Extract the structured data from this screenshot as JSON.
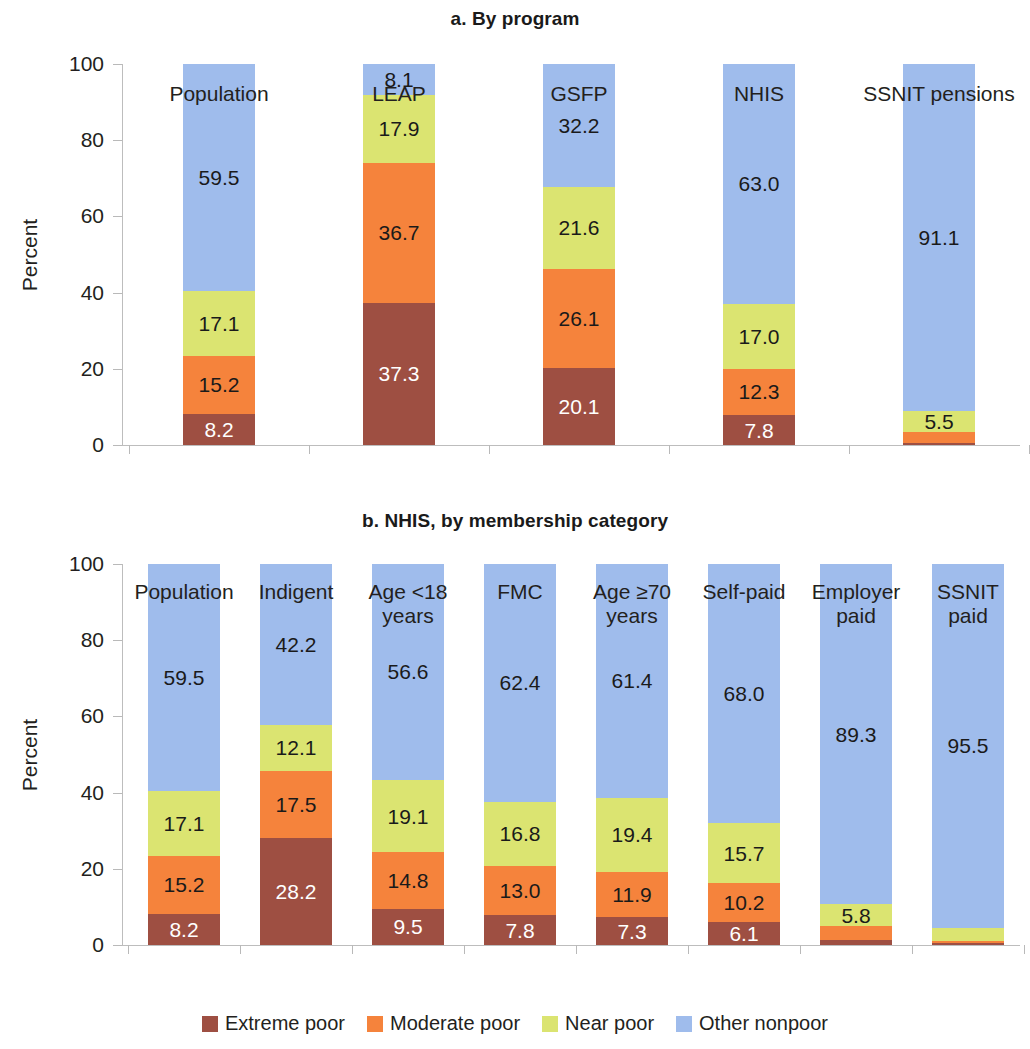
{
  "figure": {
    "legend": [
      {
        "label": "Extreme poor",
        "color": "#9e4f42"
      },
      {
        "label": "Moderate poor",
        "color": "#f5833c"
      },
      {
        "label": "Near poor",
        "color": "#dbe471"
      },
      {
        "label": "Other nonpoor",
        "color": "#9fbcec"
      }
    ]
  },
  "chart_data": [
    {
      "type": "bar",
      "stacked": true,
      "normalized": true,
      "title": "a. By program",
      "xlabel": "",
      "ylabel": "Percent",
      "ylim": [
        0,
        100
      ],
      "yticks": [
        0,
        20,
        40,
        60,
        80,
        100
      ],
      "grid": false,
      "legend_position": "bottom",
      "categories": [
        "Population",
        "LEAP",
        "GSFP",
        "NHIS",
        "SSNIT pensions"
      ],
      "series": [
        {
          "name": "Extreme poor",
          "color": "#9e4f42",
          "values": [
            8.2,
            37.3,
            20.1,
            7.8,
            0.5
          ],
          "labels": [
            "8.2",
            "37.3",
            "20.1",
            "7.8",
            ""
          ]
        },
        {
          "name": "Moderate poor",
          "color": "#f5833c",
          "values": [
            15.2,
            36.7,
            26.1,
            12.3,
            2.9
          ],
          "labels": [
            "15.2",
            "36.7",
            "26.1",
            "12.3",
            ""
          ]
        },
        {
          "name": "Near poor",
          "color": "#dbe471",
          "values": [
            17.1,
            17.9,
            21.6,
            17.0,
            5.5
          ],
          "labels": [
            "17.1",
            "17.9",
            "21.6",
            "17.0",
            "5.5"
          ]
        },
        {
          "name": "Other nonpoor",
          "color": "#9fbcec",
          "values": [
            59.5,
            8.1,
            32.2,
            63.0,
            91.1
          ],
          "labels": [
            "59.5",
            "8.1",
            "32.2",
            "63.0",
            "91.1"
          ]
        }
      ]
    },
    {
      "type": "bar",
      "stacked": true,
      "normalized": true,
      "title": "b. NHIS, by membership category",
      "xlabel": "",
      "ylabel": "Percent",
      "ylim": [
        0,
        100
      ],
      "yticks": [
        0,
        20,
        40,
        60,
        80,
        100
      ],
      "grid": false,
      "legend_position": "bottom",
      "categories": [
        "Population",
        "Indigent",
        "Age <18 years",
        "FMC",
        "Age ≥70 years",
        "Self-paid",
        "Employer paid",
        "SSNIT paid"
      ],
      "category_lines": [
        [
          "Population",
          ""
        ],
        [
          "Indigent",
          ""
        ],
        [
          "Age <18",
          "years"
        ],
        [
          "FMC",
          ""
        ],
        [
          "Age ≥70",
          "years"
        ],
        [
          "Self-paid",
          ""
        ],
        [
          "Employer",
          "paid"
        ],
        [
          "SSNIT",
          "paid"
        ]
      ],
      "series": [
        {
          "name": "Extreme poor",
          "color": "#9e4f42",
          "values": [
            8.2,
            28.2,
            9.5,
            7.8,
            7.3,
            6.1,
            1.2,
            0.4
          ],
          "labels": [
            "8.2",
            "28.2",
            "9.5",
            "7.8",
            "7.3",
            "6.1",
            "",
            ""
          ]
        },
        {
          "name": "Moderate poor",
          "color": "#f5833c",
          "values": [
            15.2,
            17.5,
            14.8,
            13.0,
            11.9,
            10.2,
            3.7,
            0.6
          ],
          "labels": [
            "15.2",
            "17.5",
            "14.8",
            "13.0",
            "11.9",
            "10.2",
            "",
            ""
          ]
        },
        {
          "name": "Near poor",
          "color": "#dbe471",
          "values": [
            17.1,
            12.1,
            19.1,
            16.8,
            19.4,
            15.7,
            5.8,
            3.5
          ],
          "labels": [
            "17.1",
            "12.1",
            "19.1",
            "16.8",
            "19.4",
            "15.7",
            "5.8",
            ""
          ]
        },
        {
          "name": "Other nonpoor",
          "color": "#9fbcec",
          "values": [
            59.5,
            42.2,
            56.6,
            62.4,
            61.4,
            68.0,
            89.3,
            95.5
          ],
          "labels": [
            "59.5",
            "42.2",
            "56.6",
            "62.4",
            "61.4",
            "68.0",
            "89.3",
            "95.5"
          ]
        }
      ]
    }
  ]
}
